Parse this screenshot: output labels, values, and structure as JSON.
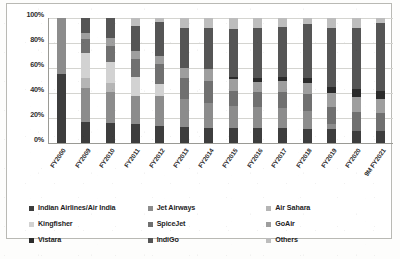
{
  "chart_data": {
    "type": "bar",
    "stacked": true,
    "normalized_percent": true,
    "title": "",
    "xlabel": "",
    "ylabel": "",
    "ylim": [
      0,
      100
    ],
    "ytick_labels": [
      "0%",
      "20%",
      "40%",
      "60%",
      "80%",
      "100%"
    ],
    "ytick_values": [
      0,
      20,
      40,
      60,
      80,
      100
    ],
    "grid": true,
    "legend_position": "bottom",
    "categories": [
      "FY2000",
      "FY2009",
      "FY2010",
      "FY2011",
      "FY2012",
      "FY2013",
      "FY2014",
      "FY2015",
      "FY2016",
      "FY2017",
      "FY2018",
      "FY2019",
      "FY2020",
      "9M FY2021"
    ],
    "series": [
      {
        "name": "Indian Airlines/Air India",
        "color": "#3d3d3d",
        "values": [
          55,
          17,
          16,
          15,
          14,
          13,
          12,
          12,
          12,
          12,
          11,
          11,
          10,
          10
        ]
      },
      {
        "name": "Jet Airways",
        "color": "#8c8c8c",
        "values": [
          45,
          27,
          25,
          23,
          24,
          22,
          20,
          18,
          17,
          16,
          15,
          4,
          0,
          0
        ]
      },
      {
        "name": "Air Sahara",
        "color": "#b5b5b5",
        "values": [
          0,
          8,
          7,
          0,
          0,
          0,
          0,
          0,
          0,
          0,
          0,
          0,
          0,
          0
        ]
      },
      {
        "name": "Kingfisher",
        "color": "#d2d2d2",
        "values": [
          0,
          20,
          17,
          15,
          9,
          0,
          0,
          0,
          0,
          0,
          0,
          0,
          0,
          0
        ]
      },
      {
        "name": "SpiceJet",
        "color": "#707070",
        "values": [
          0,
          11,
          13,
          14,
          16,
          17,
          18,
          12,
          12,
          13,
          13,
          14,
          15,
          14
        ]
      },
      {
        "name": "GoAir",
        "color": "#9e9e9e",
        "values": [
          0,
          5,
          6,
          7,
          7,
          8,
          9,
          9,
          8,
          9,
          9,
          11,
          12,
          11
        ]
      },
      {
        "name": "Vistara",
        "color": "#2b2b2b",
        "values": [
          0,
          0,
          0,
          0,
          0,
          0,
          0,
          2,
          3,
          3,
          4,
          5,
          6,
          7
        ]
      },
      {
        "name": "IndiGo",
        "color": "#555555",
        "values": [
          0,
          12,
          16,
          20,
          27,
          32,
          33,
          38,
          40,
          40,
          43,
          47,
          49,
          54
        ]
      },
      {
        "name": "Others",
        "color": "#bdbdbd",
        "values": [
          0,
          0,
          0,
          6,
          3,
          8,
          8,
          9,
          8,
          7,
          5,
          8,
          8,
          4
        ]
      }
    ]
  },
  "axis": {
    "y_ticks": [
      "100%",
      "80%",
      "60%",
      "40%",
      "20%",
      "0%"
    ]
  },
  "legend": {
    "items": [
      {
        "label": "Indian Airlines/Air India",
        "color": "#3d3d3d"
      },
      {
        "label": "Jet Airways",
        "color": "#8c8c8c"
      },
      {
        "label": "Air Sahara",
        "color": "#b5b5b5"
      },
      {
        "label": "Kingfisher",
        "color": "#d2d2d2"
      },
      {
        "label": "SpiceJet",
        "color": "#707070"
      },
      {
        "label": "GoAir",
        "color": "#9e9e9e"
      },
      {
        "label": "Vistara",
        "color": "#2b2b2b"
      },
      {
        "label": "IndiGo",
        "color": "#555555"
      },
      {
        "label": "Others",
        "color": "#bdbdbd"
      }
    ]
  }
}
